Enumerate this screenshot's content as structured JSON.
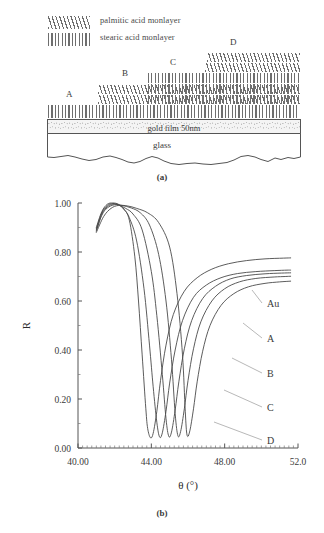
{
  "figure": {
    "panel_a_caption": "(a)",
    "panel_b_caption": "(b)"
  },
  "schematic": {
    "legend": [
      {
        "pattern": "slanted-hatch",
        "label": "palmitic acid monlayer"
      },
      {
        "pattern": "vertical-hatch",
        "label": "stearic acid monlayer"
      }
    ],
    "region_labels": [
      "A",
      "B",
      "C",
      "D"
    ],
    "substrate": {
      "gold_label": "gold film 50nm",
      "glass_label": "glass"
    },
    "stack": [
      {
        "region": "A",
        "x": 48,
        "width": 252,
        "layers": [
          {
            "pattern": "vertical-hatch",
            "height": 13
          }
        ]
      },
      {
        "region": "B",
        "x": 98,
        "width": 202,
        "layers": [
          {
            "pattern": "slanted-hatch",
            "height": 9
          },
          {
            "pattern": "slanted-hatch",
            "height": 9
          }
        ]
      },
      {
        "region": "C",
        "x": 148,
        "width": 152,
        "layers": [
          {
            "pattern": "vertical-hatch",
            "height": 11
          },
          {
            "pattern": "vertical-hatch",
            "height": 11
          },
          {
            "pattern": "vertical-hatch",
            "height": 11
          }
        ]
      },
      {
        "region": "D",
        "x": 202,
        "width": 98,
        "layers": [
          {
            "pattern": "slanted-hatch",
            "height": 9
          },
          {
            "pattern": "slanted-hatch",
            "height": 9
          }
        ]
      }
    ]
  },
  "chart_data": {
    "type": "line",
    "title": "",
    "xlabel": "θ  (°)",
    "ylabel": "R",
    "xlim": [
      40.0,
      52.0
    ],
    "ylim": [
      0.0,
      1.0
    ],
    "xticks": [
      40.0,
      44.0,
      48.0,
      52.0
    ],
    "xticklabels": [
      "40.00",
      "44.00",
      "48.00",
      "52.0"
    ],
    "yticks": [
      0.0,
      0.2,
      0.4,
      0.6,
      0.8,
      1.0
    ],
    "yticklabels": [
      "0.00",
      "0.20",
      "0.40",
      "0.60",
      "0.80",
      "1.00"
    ],
    "grid": false,
    "legend_position": "right-inline-annotations",
    "annotations": [
      "Au",
      "A",
      "B",
      "C",
      "D"
    ],
    "series": [
      {
        "name": "Au",
        "resonance_angle": 43.95,
        "minimum_R": 0.042,
        "plateau_R": 0.775,
        "x": [
          41.0,
          41.3,
          41.6,
          41.9,
          42.2,
          42.5,
          42.8,
          43.1,
          43.3,
          43.5,
          43.7,
          43.8,
          43.95,
          44.1,
          44.3,
          44.5,
          44.8,
          45.2,
          45.8,
          46.5,
          47.3,
          48.2,
          49.2,
          50.2,
          51.2,
          51.6
        ],
        "y": [
          0.9,
          0.965,
          0.995,
          1.0,
          0.995,
          0.975,
          0.93,
          0.78,
          0.6,
          0.38,
          0.16,
          0.08,
          0.042,
          0.06,
          0.15,
          0.275,
          0.42,
          0.545,
          0.64,
          0.695,
          0.73,
          0.752,
          0.765,
          0.772,
          0.775,
          0.776
        ]
      },
      {
        "name": "A",
        "resonance_angle": 44.45,
        "minimum_R": 0.045,
        "plateau_R": 0.725,
        "x": [
          41.0,
          41.3,
          41.6,
          41.9,
          42.2,
          42.5,
          42.8,
          43.2,
          43.6,
          43.9,
          44.1,
          44.3,
          44.45,
          44.6,
          44.8,
          45.0,
          45.3,
          45.7,
          46.3,
          47.0,
          47.8,
          48.7,
          49.7,
          50.7,
          51.4,
          51.6
        ],
        "y": [
          0.895,
          0.96,
          0.99,
          0.998,
          0.993,
          0.975,
          0.94,
          0.845,
          0.65,
          0.42,
          0.25,
          0.105,
          0.045,
          0.062,
          0.15,
          0.265,
          0.4,
          0.52,
          0.615,
          0.665,
          0.695,
          0.712,
          0.72,
          0.724,
          0.726,
          0.726
        ]
      },
      {
        "name": "B",
        "resonance_angle": 44.95,
        "minimum_R": 0.048,
        "plateau_R": 0.715,
        "x": [
          41.0,
          41.3,
          41.6,
          41.9,
          42.2,
          42.6,
          43.0,
          43.5,
          44.0,
          44.3,
          44.6,
          44.8,
          44.95,
          45.1,
          45.3,
          45.5,
          45.8,
          46.2,
          46.8,
          47.5,
          48.3,
          49.2,
          50.2,
          51.1,
          51.6
        ],
        "y": [
          0.89,
          0.955,
          0.985,
          0.995,
          0.992,
          0.978,
          0.955,
          0.89,
          0.72,
          0.54,
          0.3,
          0.12,
          0.048,
          0.065,
          0.155,
          0.27,
          0.405,
          0.52,
          0.61,
          0.66,
          0.69,
          0.704,
          0.711,
          0.714,
          0.715
        ]
      },
      {
        "name": "C",
        "resonance_angle": 45.45,
        "minimum_R": 0.05,
        "plateau_R": 0.7,
        "x": [
          41.0,
          41.3,
          41.6,
          42.0,
          42.4,
          42.9,
          43.4,
          43.9,
          44.4,
          44.8,
          45.1,
          45.3,
          45.45,
          45.6,
          45.8,
          46.0,
          46.3,
          46.7,
          47.3,
          48.0,
          48.8,
          49.7,
          50.7,
          51.3,
          51.6
        ],
        "y": [
          0.885,
          0.95,
          0.98,
          0.993,
          0.99,
          0.98,
          0.96,
          0.91,
          0.79,
          0.6,
          0.36,
          0.14,
          0.05,
          0.068,
          0.16,
          0.275,
          0.405,
          0.515,
          0.6,
          0.65,
          0.678,
          0.692,
          0.698,
          0.7,
          0.701
        ]
      },
      {
        "name": "D",
        "resonance_angle": 45.95,
        "minimum_R": 0.052,
        "plateau_R": 0.68,
        "x": [
          41.0,
          41.4,
          41.8,
          42.2,
          42.7,
          43.2,
          43.8,
          44.4,
          45.0,
          45.4,
          45.7,
          45.85,
          45.95,
          46.1,
          46.3,
          46.5,
          46.8,
          47.2,
          47.8,
          48.5,
          49.3,
          50.2,
          51.0,
          51.6
        ],
        "y": [
          0.88,
          0.945,
          0.978,
          0.99,
          0.988,
          0.978,
          0.96,
          0.92,
          0.82,
          0.63,
          0.38,
          0.15,
          0.052,
          0.07,
          0.16,
          0.27,
          0.395,
          0.5,
          0.582,
          0.63,
          0.658,
          0.672,
          0.678,
          0.681
        ]
      }
    ]
  }
}
